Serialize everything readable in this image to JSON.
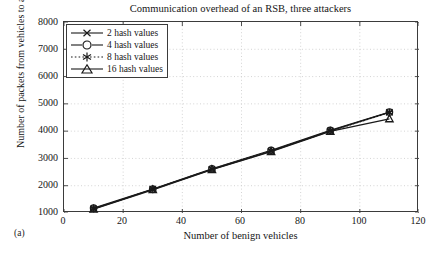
{
  "figure": {
    "subfigure_label": "(a)"
  },
  "chart_data": {
    "type": "line",
    "title": "Communication overhead of an RSB, three attackers",
    "xlabel": "Number of benign vehicles",
    "ylabel": "Number of packets from vehicles to an RSB",
    "xlim": [
      0,
      120
    ],
    "ylim": [
      1000,
      8000
    ],
    "xticks": [
      0,
      20,
      40,
      60,
      80,
      100,
      120
    ],
    "yticks": [
      1000,
      2000,
      3000,
      4000,
      5000,
      6000,
      7000,
      8000
    ],
    "grid": true,
    "legend_position": "top-left",
    "x": [
      10,
      30,
      50,
      70,
      90,
      110
    ],
    "series": [
      {
        "name": "2 hash values",
        "marker": "x-cross",
        "line_style": "solid",
        "color": "#1a1a1a",
        "values": [
          1150,
          1870,
          2600,
          3270,
          4010,
          4690
        ]
      },
      {
        "name": "4 hash values",
        "marker": "circle",
        "line_style": "solid",
        "color": "#1a1a1a",
        "values": [
          1180,
          1880,
          2620,
          3300,
          4030,
          4700
        ]
      },
      {
        "name": "8 hash values",
        "marker": "asterisk",
        "line_style": "dotted",
        "color": "#1a1a1a",
        "values": [
          1160,
          1860,
          2610,
          3280,
          4000,
          4680
        ]
      },
      {
        "name": "16 hash values",
        "marker": "triangle",
        "line_style": "solid",
        "color": "#1a1a1a",
        "values": [
          1140,
          1850,
          2590,
          3250,
          3990,
          4450
        ]
      }
    ]
  },
  "axes": {
    "y_tick_labels": [
      "8000",
      "7000",
      "6000",
      "5000",
      "4000",
      "3000",
      "2000",
      "1000"
    ],
    "x_tick_labels": [
      "0",
      "20",
      "40",
      "60",
      "80",
      "100",
      "120"
    ]
  },
  "legend": {
    "items": [
      {
        "label": "2 hash values"
      },
      {
        "label": "4 hash values"
      },
      {
        "label": "8 hash values"
      },
      {
        "label": "16 hash values"
      }
    ]
  },
  "colors": {
    "ink": "#1a1a1a",
    "axis": "#3b3b3b",
    "grid": "#c9c9c9",
    "background": "#ffffff"
  }
}
